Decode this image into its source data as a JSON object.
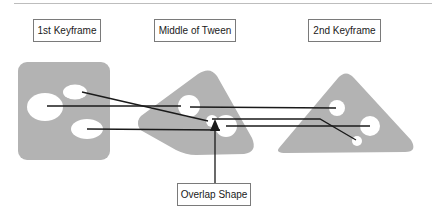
{
  "labels": {
    "first_keyframe": "1st Keyframe",
    "middle_of_tween": "Middle of Tween",
    "second_keyframe": "2nd Keyframe",
    "overlap_shape": "Overlap Shape"
  },
  "colors": {
    "shape_fill": "#b3b3b3",
    "hole_fill": "#ffffff",
    "line": "#1a1a1a",
    "box_border": "#7a7a7a",
    "divider": "#bdbdbd"
  }
}
